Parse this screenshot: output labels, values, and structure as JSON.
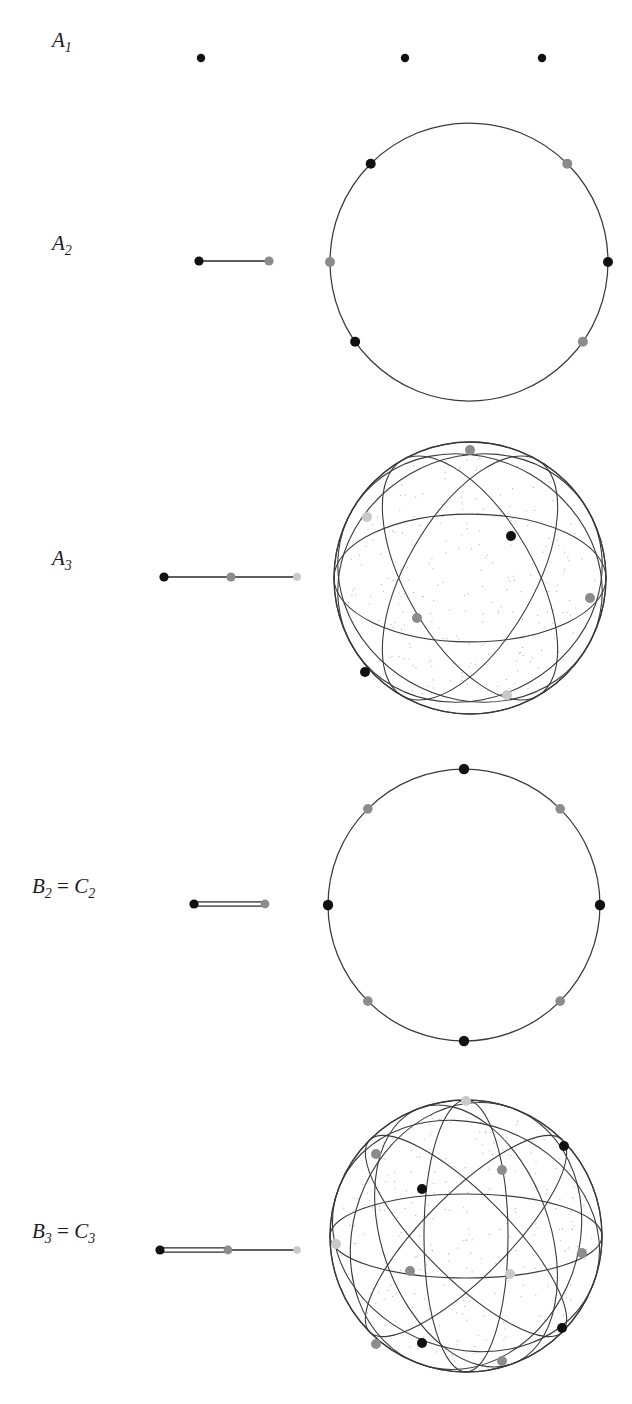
{
  "figure": {
    "caption": "",
    "background": "#ffffff",
    "colors": {
      "black_node": "#111111",
      "gray_node": "#8c8c8c",
      "light_node": "#c9c9c9",
      "line": "#2b2b2b",
      "sphere_line": "#3a3a3a",
      "stipple": "#9a9a9a"
    }
  },
  "rows": [
    {
      "id": "A1",
      "label_parts": {
        "base": "A",
        "sub": "1",
        "equals": "",
        "base2": "",
        "sub2": ""
      },
      "label_text": "A1",
      "label_x": 52,
      "label_y": 47,
      "diagram": {
        "name": "dynkin-diagram-a1",
        "x": 150,
        "y": 38,
        "w": 160,
        "h": 40,
        "nodes": [
          {
            "cx": 51,
            "cy": 20,
            "r": 4.2,
            "color": "black"
          }
        ],
        "edges": []
      },
      "sphere": {
        "name": "reflection-arrangement-s0",
        "x": 330,
        "y": 30,
        "w": 280,
        "h": 56,
        "type": "points-only",
        "cx": 139,
        "cy": 28,
        "r": 0,
        "circles": [],
        "points": [
          {
            "cx": 75,
            "cy": 28,
            "r": 4.2,
            "color": "black"
          },
          {
            "cx": 212,
            "cy": 28,
            "r": 4.2,
            "color": "black"
          }
        ]
      }
    },
    {
      "id": "A2",
      "label_parts": {
        "base": "A",
        "sub": "2",
        "equals": "",
        "base2": "",
        "sub2": ""
      },
      "label_text": "A2",
      "label_x": 52,
      "label_y": 250,
      "diagram": {
        "name": "dynkin-diagram-a2",
        "x": 150,
        "y": 241,
        "w": 160,
        "h": 40,
        "nodes": [
          {
            "cx": 49,
            "cy": 20,
            "r": 4.6,
            "color": "black"
          },
          {
            "cx": 119,
            "cy": 20,
            "r": 4.6,
            "color": "gray"
          }
        ],
        "edges": [
          {
            "x1": 49,
            "y1": 20,
            "x2": 119,
            "y2": 20,
            "multiplicity": 1
          }
        ]
      },
      "sphere": {
        "name": "reflection-arrangement-a2-circle",
        "x": 330,
        "y": 122,
        "w": 280,
        "h": 280,
        "type": "circle",
        "cx": 139,
        "cy": 140,
        "r": 139,
        "circles": [],
        "points": [
          {
            "angle": 135,
            "r": 5.0,
            "color": "black"
          },
          {
            "angle": 45,
            "r": 5.0,
            "color": "gray"
          },
          {
            "angle": 180,
            "r": 5.0,
            "color": "gray"
          },
          {
            "angle": 0,
            "r": 5.0,
            "color": "black"
          },
          {
            "angle": 215,
            "r": 5.0,
            "color": "black"
          },
          {
            "angle": 325,
            "r": 5.0,
            "color": "gray"
          }
        ]
      }
    },
    {
      "id": "A3",
      "label_parts": {
        "base": "A",
        "sub": "3",
        "equals": "",
        "base2": "",
        "sub2": ""
      },
      "label_text": "A3",
      "label_x": 52,
      "label_y": 565,
      "diagram": {
        "name": "dynkin-diagram-a3",
        "x": 150,
        "y": 557,
        "w": 170,
        "h": 40,
        "nodes": [
          {
            "cx": 14,
            "cy": 20,
            "r": 4.6,
            "color": "black"
          },
          {
            "cx": 81,
            "cy": 20,
            "r": 4.6,
            "color": "gray"
          },
          {
            "cx": 147,
            "cy": 20,
            "r": 4.0,
            "color": "light"
          }
        ],
        "edges": [
          {
            "x1": 14,
            "y1": 20,
            "x2": 81,
            "y2": 20,
            "multiplicity": 1
          },
          {
            "x1": 81,
            "y1": 20,
            "x2": 147,
            "y2": 20,
            "multiplicity": 1
          }
        ]
      },
      "sphere": {
        "name": "reflection-arrangement-a3-sphere",
        "x": 332,
        "y": 440,
        "w": 276,
        "h": 276,
        "type": "sphere",
        "cx": 138,
        "cy": 138,
        "r": 136,
        "great_circles": [
          {
            "tiltX": 0,
            "tiltY": 0,
            "rot": 0
          },
          {
            "tiltX": 62,
            "tiltY": 0,
            "rot": 0
          },
          {
            "tiltX": 62,
            "tiltY": 0,
            "rot": 60
          },
          {
            "tiltX": 62,
            "tiltY": 0,
            "rot": 120
          },
          {
            "tiltX": 28,
            "tiltY": 0,
            "rot": 30
          },
          {
            "tiltX": 28,
            "tiltY": 0,
            "rot": 150
          }
        ],
        "vertices": [
          {
            "cx": 138,
            "cy": 10,
            "r": 5.0,
            "color": "gray"
          },
          {
            "cx": 35,
            "cy": 77,
            "r": 5.0,
            "color": "light"
          },
          {
            "cx": 179,
            "cy": 96,
            "r": 5.0,
            "color": "black"
          },
          {
            "cx": 85,
            "cy": 178,
            "r": 5.0,
            "color": "gray"
          },
          {
            "cx": 258,
            "cy": 158,
            "r": 5.0,
            "color": "gray"
          },
          {
            "cx": 33,
            "cy": 232,
            "r": 5.0,
            "color": "black"
          },
          {
            "cx": 175,
            "cy": 255,
            "r": 5.0,
            "color": "light"
          }
        ]
      }
    },
    {
      "id": "B2=C2",
      "label_parts": {
        "base": "B",
        "sub": "2",
        "equals": "=",
        "base2": "C",
        "sub2": "2"
      },
      "label_text": "B2 = C2",
      "label_x": 32,
      "label_y": 893,
      "diagram": {
        "name": "dynkin-diagram-b2-c2",
        "x": 150,
        "y": 884,
        "w": 170,
        "h": 40,
        "nodes": [
          {
            "cx": 44,
            "cy": 20,
            "r": 4.6,
            "color": "black"
          },
          {
            "cx": 115,
            "cy": 20,
            "r": 4.4,
            "color": "gray"
          }
        ],
        "edges": [
          {
            "x1": 44,
            "y1": 20,
            "x2": 115,
            "y2": 20,
            "multiplicity": 2
          }
        ]
      },
      "sphere": {
        "name": "reflection-arrangement-b2-circle",
        "x": 328,
        "y": 768,
        "w": 274,
        "h": 274,
        "type": "circle",
        "cx": 136,
        "cy": 137,
        "r": 136,
        "circles": [],
        "points": [
          {
            "angle": 90,
            "r": 5.2,
            "color": "black"
          },
          {
            "angle": 135,
            "r": 4.8,
            "color": "gray"
          },
          {
            "angle": 180,
            "r": 5.2,
            "color": "black"
          },
          {
            "angle": 225,
            "r": 4.8,
            "color": "gray"
          },
          {
            "angle": 270,
            "r": 5.2,
            "color": "black"
          },
          {
            "angle": 315,
            "r": 4.8,
            "color": "gray"
          },
          {
            "angle": 0,
            "r": 5.2,
            "color": "black"
          },
          {
            "angle": 45,
            "r": 4.8,
            "color": "gray"
          }
        ]
      }
    },
    {
      "id": "B3=C3",
      "label_parts": {
        "base": "B",
        "sub": "3",
        "equals": "=",
        "base2": "C",
        "sub2": "3"
      },
      "label_text": "B3 = C3",
      "label_x": 32,
      "label_y": 1238,
      "diagram": {
        "name": "dynkin-diagram-b3-c3",
        "x": 150,
        "y": 1230,
        "w": 170,
        "h": 40,
        "nodes": [
          {
            "cx": 10,
            "cy": 20,
            "r": 4.6,
            "color": "black"
          },
          {
            "cx": 78,
            "cy": 20,
            "r": 4.4,
            "color": "gray"
          },
          {
            "cx": 147,
            "cy": 20,
            "r": 3.8,
            "color": "light"
          }
        ],
        "edges": [
          {
            "x1": 10,
            "y1": 20,
            "x2": 78,
            "y2": 20,
            "multiplicity": 2
          },
          {
            "x1": 78,
            "y1": 20,
            "x2": 147,
            "y2": 20,
            "multiplicity": 1
          }
        ]
      },
      "sphere": {
        "name": "reflection-arrangement-b3-sphere",
        "x": 330,
        "y": 1096,
        "w": 276,
        "h": 282,
        "type": "sphere",
        "cx": 136,
        "cy": 140,
        "r": 136,
        "great_circles": [
          {
            "tiltX": 0,
            "tiltY": 0,
            "rot": 0
          },
          {
            "tiltX": 72,
            "tiltY": 0,
            "rot": 0
          },
          {
            "tiltX": 72,
            "tiltY": 0,
            "rot": 45
          },
          {
            "tiltX": 72,
            "tiltY": 0,
            "rot": 90
          },
          {
            "tiltX": 72,
            "tiltY": 0,
            "rot": 135
          },
          {
            "tiltX": 34,
            "tiltY": 0,
            "rot": 20
          },
          {
            "tiltX": 34,
            "tiltY": 0,
            "rot": 110
          },
          {
            "tiltX": 52,
            "tiltY": 0,
            "rot": 70
          }
        ],
        "vertices": [
          {
            "cx": 136,
            "cy": 5,
            "r": 5.0,
            "color": "light"
          },
          {
            "cx": 46,
            "cy": 58,
            "r": 5.0,
            "color": "gray"
          },
          {
            "cx": 234,
            "cy": 50,
            "r": 5.0,
            "color": "black"
          },
          {
            "cx": 92,
            "cy": 93,
            "r": 5.0,
            "color": "black"
          },
          {
            "cx": 172,
            "cy": 74,
            "r": 5.0,
            "color": "gray"
          },
          {
            "cx": 6,
            "cy": 148,
            "r": 5.0,
            "color": "light"
          },
          {
            "cx": 80,
            "cy": 175,
            "r": 5.0,
            "color": "gray"
          },
          {
            "cx": 180,
            "cy": 178,
            "r": 5.0,
            "color": "light"
          },
          {
            "cx": 252,
            "cy": 157,
            "r": 5.0,
            "color": "gray"
          },
          {
            "cx": 46,
            "cy": 248,
            "r": 5.0,
            "color": "gray"
          },
          {
            "cx": 92,
            "cy": 247,
            "r": 5.0,
            "color": "black"
          },
          {
            "cx": 232,
            "cy": 232,
            "r": 5.0,
            "color": "black"
          },
          {
            "cx": 172,
            "cy": 265,
            "r": 5.0,
            "color": "gray"
          }
        ]
      }
    }
  ]
}
